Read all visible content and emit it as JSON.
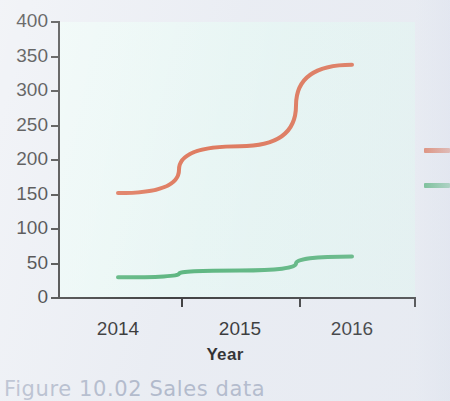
{
  "figure": {
    "caption": "Figure 10.02 Sales data",
    "background_color": "#eaedf3",
    "plot_background_color": "#e6f6f3"
  },
  "chart_data": {
    "type": "line",
    "title": "",
    "subtitle": "",
    "xlabel": "Year",
    "ylabel": "",
    "categories": [
      "2014",
      "2015",
      "2016"
    ],
    "x": [
      2014,
      2015,
      2016
    ],
    "xtick_labels": [
      "2014",
      "2015",
      "2016"
    ],
    "ytick_labels": [
      "0",
      "50",
      "100",
      "150",
      "200",
      "250",
      "300",
      "350",
      "400"
    ],
    "ytick_values": [
      0,
      50,
      100,
      150,
      200,
      250,
      300,
      350,
      400
    ],
    "ylim": [
      0,
      400
    ],
    "grid": false,
    "legend_position": "right",
    "series": [
      {
        "name": "series-1",
        "color": "#dd6b4b",
        "values": [
          152,
          220,
          338
        ]
      },
      {
        "name": "series-2",
        "color": "#4caf72",
        "values": [
          30,
          40,
          60
        ]
      }
    ]
  },
  "legend": {
    "items": [
      {
        "name": "legend-swatch-orange",
        "color": "#dd6b4b",
        "label": ""
      },
      {
        "name": "legend-swatch-green",
        "color": "#4caf72",
        "label": ""
      }
    ]
  }
}
